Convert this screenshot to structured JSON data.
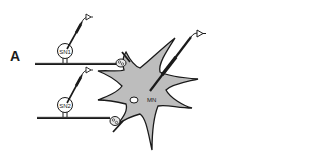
{
  "figure": {
    "panel_label": "A",
    "neurons": {
      "sensory_1": {
        "label": "SN1"
      },
      "sensory_2": {
        "label": "SN2"
      },
      "motor": {
        "label": "MN"
      }
    },
    "colors": {
      "soma_fill": "#bdbdbd",
      "stroke": "#1a1a1a",
      "background": "#ffffff"
    }
  }
}
